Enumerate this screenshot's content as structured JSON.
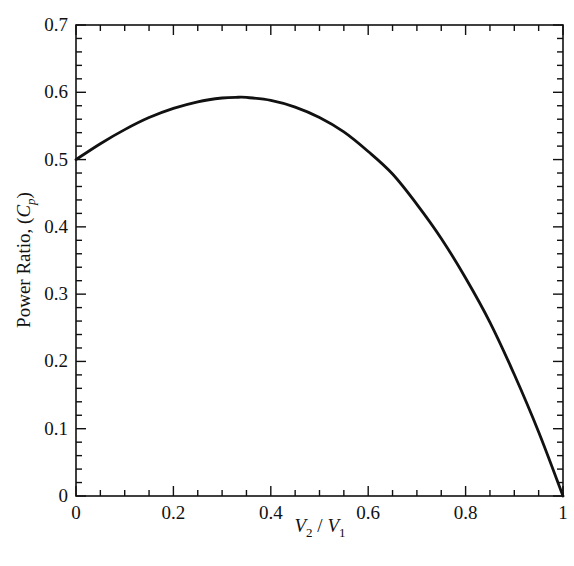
{
  "chart_data": {
    "type": "line",
    "title": "",
    "xlabel": "V2 / V1",
    "ylabel": "Power Ratio, (Cp)",
    "xlim": [
      0,
      1
    ],
    "ylim": [
      0,
      0.7
    ],
    "grid": false,
    "legend": null,
    "x_ticks": [
      "0",
      "0.2",
      "0.4",
      "0.6",
      "0.8",
      "1"
    ],
    "y_ticks": [
      "0",
      "0.1",
      "0.2",
      "0.3",
      "0.4",
      "0.5",
      "0.6",
      "0.7"
    ],
    "series": [
      {
        "name": "Cp",
        "x": [
          0,
          0.05,
          0.1,
          0.15,
          0.2,
          0.25,
          0.3,
          0.3333,
          0.35,
          0.4,
          0.45,
          0.5,
          0.55,
          0.6,
          0.65,
          0.7,
          0.75,
          0.8,
          0.85,
          0.9,
          0.95,
          1.0
        ],
        "values": [
          0.5,
          0.5236,
          0.5445,
          0.5624,
          0.576,
          0.5859,
          0.5915,
          0.5926,
          0.5923,
          0.588,
          0.578,
          0.5625,
          0.5411,
          0.512,
          0.4785,
          0.4335,
          0.3828,
          0.324,
          0.2581,
          0.1805,
          0.0951,
          0.0
        ]
      }
    ]
  },
  "plot": {
    "xlabel_main1": "V",
    "xlabel_sub1": "2",
    "xlabel_sep": " / ",
    "xlabel_main2": "V",
    "xlabel_sub2": "1",
    "ylabel_text": "Power Ratio, (",
    "ylabel_c": "C",
    "ylabel_sub": "p",
    "ylabel_close": ")"
  }
}
